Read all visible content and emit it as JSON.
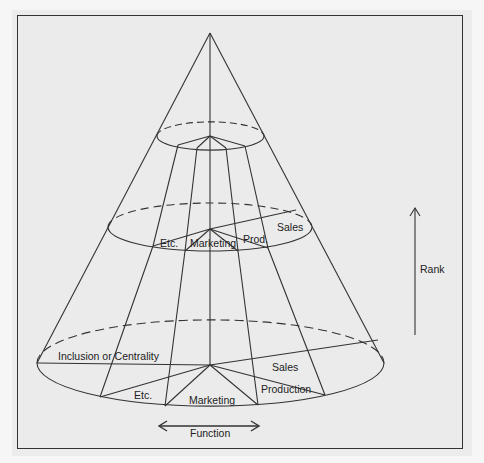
{
  "figure": {
    "type": "cone-diagram",
    "colors": {
      "background": "#ebebeb",
      "stroke": "#333333",
      "text": "#222222"
    }
  },
  "levels": {
    "top": {
      "slices": []
    },
    "middle": {
      "labels": {
        "etc": "Etc.",
        "marketing": "Marketing",
        "prod": "Prod.",
        "sales": "Sales"
      }
    },
    "bottom": {
      "labels": {
        "inclusion": "Inclusion or Centrality",
        "etc": "Etc.",
        "marketing": "Marketing",
        "production": "Production",
        "sales": "Sales"
      }
    }
  },
  "axes": {
    "rank": {
      "label": "Rank",
      "direction": "up"
    },
    "function": {
      "label": "Function",
      "direction": "left-right"
    }
  }
}
